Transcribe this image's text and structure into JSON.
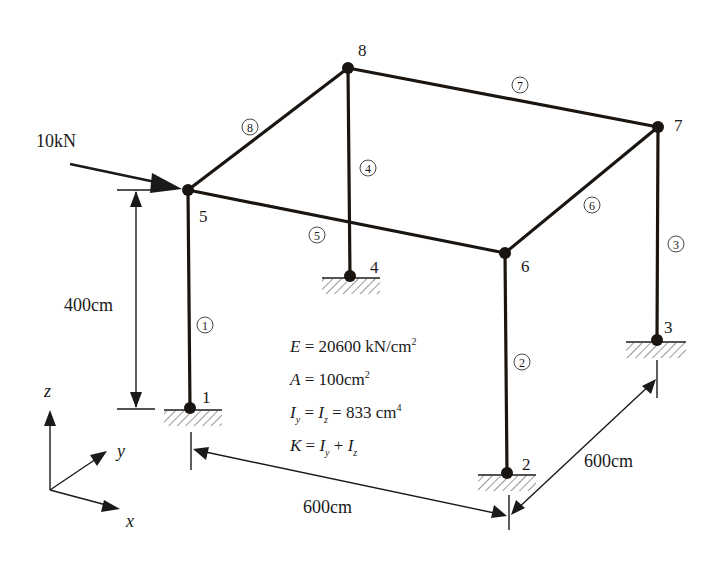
{
  "diagram": {
    "type": "3D space frame structural model",
    "load": {
      "label": "10kN",
      "applied_at_node": "5"
    },
    "nodes": [
      {
        "id": "1",
        "label": "1",
        "x": 190,
        "y": 408,
        "support": "fixed"
      },
      {
        "id": "2",
        "label": "2",
        "x": 507,
        "y": 473,
        "support": "fixed"
      },
      {
        "id": "3",
        "label": "3",
        "x": 657,
        "y": 340,
        "support": "fixed"
      },
      {
        "id": "4",
        "label": "4",
        "x": 350,
        "y": 276,
        "support": "fixed"
      },
      {
        "id": "5",
        "label": "5",
        "x": 188,
        "y": 190
      },
      {
        "id": "6",
        "label": "6",
        "x": 505,
        "y": 253
      },
      {
        "id": "7",
        "label": "7",
        "x": 658,
        "y": 127
      },
      {
        "id": "8",
        "label": "8",
        "x": 348,
        "y": 68
      }
    ],
    "members": [
      {
        "id": "1",
        "label": "①",
        "from": "1",
        "to": "5"
      },
      {
        "id": "2",
        "label": "②",
        "from": "2",
        "to": "6"
      },
      {
        "id": "3",
        "label": "③",
        "from": "3",
        "to": "7"
      },
      {
        "id": "4",
        "label": "④",
        "from": "4",
        "to": "8"
      },
      {
        "id": "5",
        "label": "⑤",
        "from": "5",
        "to": "6"
      },
      {
        "id": "6",
        "label": "⑥",
        "from": "6",
        "to": "7"
      },
      {
        "id": "7",
        "label": "⑦",
        "from": "8",
        "to": "7"
      },
      {
        "id": "8",
        "label": "⑧",
        "from": "5",
        "to": "8"
      }
    ],
    "dimensions": {
      "height": "400cm",
      "width_x": "600cm",
      "depth_y": "600cm"
    },
    "properties": {
      "E": {
        "symbol": "E",
        "value": "20600",
        "unit": "kN/cm",
        "exp": "2"
      },
      "A": {
        "symbol": "A",
        "value": "100",
        "unit": "cm",
        "exp": "2"
      },
      "I": {
        "symbol1": "I",
        "sub1": "y",
        "symbol2": "I",
        "sub2": "z",
        "value": "833",
        "unit": "cm",
        "exp": "4"
      },
      "K": {
        "symbol": "K",
        "t1": "I",
        "s1": "y",
        "t2": "I",
        "s2": "z"
      }
    },
    "axes": {
      "x": "x",
      "y": "y",
      "z": "z"
    }
  }
}
